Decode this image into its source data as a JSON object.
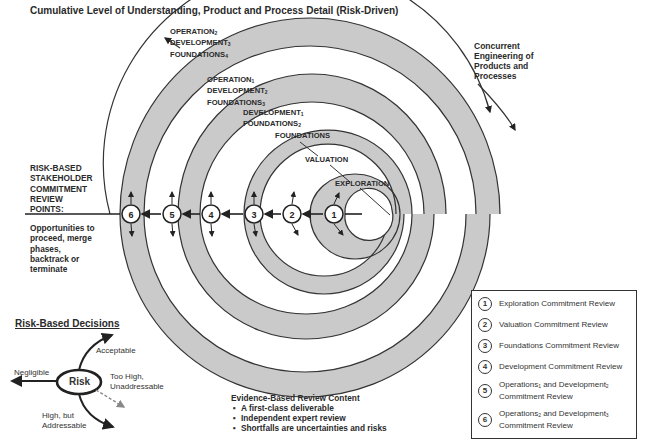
{
  "title": "Cumulative Level of Understanding, Product and Process Detail (Risk-Driven)",
  "concurrent_engineering": [
    "Concurrent",
    "Engineering of",
    "Products and",
    "Processes"
  ],
  "spiral_labels": {
    "exploration": "EXPLORATION",
    "valuation": "VALUATION",
    "foundations": "FOUNDATIONS",
    "dev1_found2": {
      "line1": "DEVELOPMENT",
      "sub1": "1",
      "line2": "FOUNDATIONS",
      "sub2": "2"
    },
    "op1_dev2_found3": {
      "line1": "OPERATION",
      "sub1": "1",
      "line2": "DEVELOPMENT",
      "sub2": "2",
      "line3": "FOUNDATIONS",
      "sub3": "3"
    },
    "op2_dev3_found4": {
      "line1": "OPERATION",
      "sub1": "2",
      "line2": "DEVELOPMENT",
      "sub2": "3",
      "line3": "FOUNDATIONS",
      "sub3": "4"
    }
  },
  "review_points_label": [
    "RISK-BASED",
    "STAKEHOLDER",
    "COMMITMENT",
    "REVIEW",
    "POINTS:"
  ],
  "opportunities_label": [
    "Opportunities to",
    "proceed, merge",
    "phases,",
    "backtrack or",
    "terminate"
  ],
  "review_points": [
    {
      "num": "1",
      "x": 334
    },
    {
      "num": "2",
      "x": 292
    },
    {
      "num": "3",
      "x": 254
    },
    {
      "num": "4",
      "x": 211
    },
    {
      "num": "5",
      "x": 172
    },
    {
      "num": "6",
      "x": 131
    }
  ],
  "legend": {
    "items": [
      {
        "num": "1",
        "text": "Exploration Commitment Review"
      },
      {
        "num": "2",
        "text": "Valuation Commitment Review"
      },
      {
        "num": "3",
        "text": "Foundations Commitment Review"
      },
      {
        "num": "4",
        "text": "Development Commitment Review"
      },
      {
        "num": "5",
        "text_a": "Operations",
        "sub_a": "1",
        "text_b": " and Development",
        "sub_b": "2",
        "text_c": "Commitment Review"
      },
      {
        "num": "6",
        "text_a": "Operations",
        "sub_a": "2",
        "text_b": " and Development",
        "sub_b": "3",
        "text_c": "Commitment Review"
      }
    ]
  },
  "risk_decisions": {
    "title": "Risk-Based Decisions",
    "center": "Risk",
    "acceptable": "Acceptable",
    "negligible": "Negligible",
    "too_high": [
      "Too High,",
      "Unaddressable"
    ],
    "high_but": [
      "High, but",
      "Addressable"
    ]
  },
  "evidence": {
    "title": "Evidence-Based Review Content",
    "bullets": [
      "A first-class deliverable",
      "Independent expert review",
      "Shortfalls are uncertainties and risks"
    ]
  },
  "colors": {
    "band_gray": "#c9c9c9",
    "line": "#333333",
    "text": "#2a2a2a"
  }
}
